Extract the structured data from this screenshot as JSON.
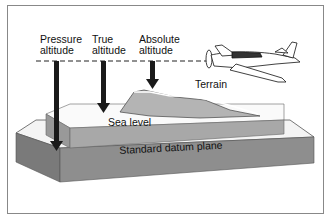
{
  "diagram": {
    "labels": {
      "pressure": [
        "Pressure",
        "altitude"
      ],
      "true": [
        "True",
        "altitude"
      ],
      "absolute": [
        "Absolute",
        "altitude"
      ],
      "terrain": "Terrain",
      "sea_level": "Sea level",
      "datum": "Standard datum plane"
    },
    "colors": {
      "arrow": "#1a1a1a",
      "slab_side": "#8a8a8a",
      "slab_top": "#f4f4f4",
      "sea_side": "#a8a8a8",
      "terrain_fill": "#b4b4b4"
    }
  }
}
